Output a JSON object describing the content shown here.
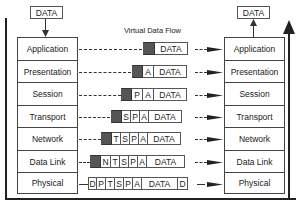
{
  "diagram": {
    "title": "Virtual Data Flow",
    "top_left_label": "DATA",
    "top_right_label": "DATA",
    "left_stack": [
      "Application",
      "Presentation",
      "Session",
      "Transport",
      "Network",
      "Data Link",
      "Physical"
    ],
    "right_stack": [
      "Application",
      "Presentation",
      "Session",
      "Transport",
      "Network",
      "Data Link",
      "Physical"
    ],
    "packets": [
      {
        "layer": "Application",
        "cells": [
          "#",
          "DATA"
        ]
      },
      {
        "layer": "Presentation",
        "cells": [
          "#",
          "A",
          "DATA"
        ]
      },
      {
        "layer": "Session",
        "cells": [
          "#",
          "P",
          "A",
          "DATA"
        ]
      },
      {
        "layer": "Transport",
        "cells": [
          "#",
          "S",
          "P",
          "A",
          "DATA"
        ]
      },
      {
        "layer": "Network",
        "cells": [
          "#",
          "T",
          "S",
          "P",
          "A",
          "DATA"
        ]
      },
      {
        "layer": "Data Link",
        "cells": [
          "#",
          "N",
          "T",
          "S",
          "P",
          "A",
          "DATA"
        ]
      },
      {
        "layer": "Physical",
        "cells": [
          "D",
          "P",
          "T",
          "S",
          "P",
          "A",
          "DATA",
          "D"
        ]
      }
    ],
    "colors": {
      "header_fill": "#555555",
      "line": "#222222"
    }
  }
}
